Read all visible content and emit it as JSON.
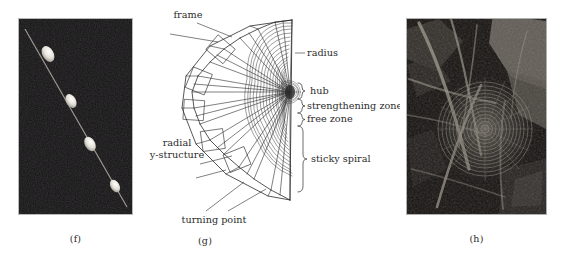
{
  "figure": {
    "background_color": "#ffffff",
    "panels": [
      {
        "id": "f",
        "caption": "(f)",
        "type": "photograph",
        "description": "dark micrograph with four pale ellipsoidal glue droplets along a diagonal silk thread",
        "bounds": {
          "x": 18,
          "y": 18,
          "width": 115,
          "height": 197
        },
        "background_color": "#120f10",
        "thread_color": "#8e8a84",
        "droplet_color": "#e8e6df",
        "droplets": [
          {
            "cx": 0.26,
            "cy": 0.18,
            "rx": 0.075,
            "ry": 0.048
          },
          {
            "cx": 0.46,
            "cy": 0.42,
            "rx": 0.065,
            "ry": 0.042
          },
          {
            "cx": 0.63,
            "cy": 0.64,
            "rx": 0.068,
            "ry": 0.044
          },
          {
            "cx": 0.85,
            "cy": 0.855,
            "rx": 0.06,
            "ry": 0.038
          }
        ]
      },
      {
        "id": "g",
        "caption": "(g)",
        "type": "line-diagram",
        "description": "schematic half orb web showing radii converging on a hub, with capture spiral and labelled zones",
        "bounds": {
          "x": 140,
          "y": 4,
          "width": 260,
          "height": 226
        },
        "line_color": "#2b2b2b",
        "labels": [
          {
            "id": "frame",
            "text": "frame",
            "x": 48,
            "y": 14,
            "anchor": "middle"
          },
          {
            "id": "radius",
            "text": "radius",
            "x": 167,
            "y": 49,
            "anchor": "start"
          },
          {
            "id": "hub",
            "text": "hub",
            "x": 172,
            "y": 90,
            "anchor": "start"
          },
          {
            "id": "strengthening",
            "text": "strengthening zone",
            "x": 167,
            "y": 106,
            "anchor": "start"
          },
          {
            "id": "free-zone",
            "text": "free zone",
            "x": 167,
            "y": 119,
            "anchor": "start"
          },
          {
            "id": "sticky-spiral",
            "text": "sticky spiral",
            "x": 172,
            "y": 157,
            "anchor": "start"
          },
          {
            "id": "radial-1",
            "text": "radial",
            "x": 37,
            "y": 141,
            "anchor": "middle"
          },
          {
            "id": "radial-2",
            "text": "y-structure",
            "x": 37,
            "y": 153,
            "anchor": "middle"
          },
          {
            "id": "turning-point",
            "text": "turning point",
            "x": 70,
            "y": 219,
            "anchor": "middle"
          }
        ],
        "zones": [
          {
            "name": "hub",
            "brace": "small"
          },
          {
            "name": "strengthening zone",
            "brace": "small"
          },
          {
            "name": "free zone",
            "brace": "small"
          },
          {
            "name": "sticky spiral",
            "brace": "large"
          }
        ]
      },
      {
        "id": "h",
        "caption": "(h)",
        "type": "photograph",
        "description": "black and white photograph of a spiral orb web built among dry grass stems and leaves",
        "bounds": {
          "x": 406,
          "y": 18,
          "width": 141,
          "height": 197
        },
        "background_color": "#1a1714",
        "web_center": {
          "cx": 0.56,
          "cy": 0.58
        },
        "highlight_color": "#cfcabd"
      }
    ]
  }
}
